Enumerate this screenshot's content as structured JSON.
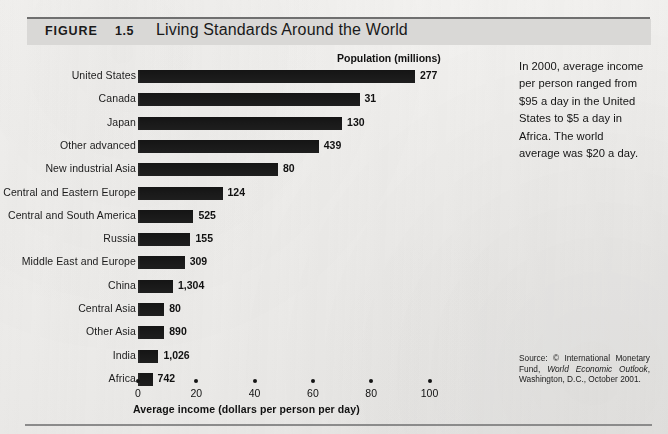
{
  "figure": {
    "kicker": "FIGURE",
    "number": "1.5",
    "title": "Living Standards Around the World"
  },
  "chart_data": {
    "type": "bar",
    "orientation": "horizontal",
    "title": "Living Standards Around the World",
    "xlabel": "Average income (dollars per person per day)",
    "ylabel": "",
    "xlim": [
      0,
      110
    ],
    "xticks": [
      0,
      20,
      40,
      60,
      80,
      100
    ],
    "grid": false,
    "legend": "none",
    "value_column_header": "Population (millions)",
    "categories": [
      "United States",
      "Canada",
      "Japan",
      "Other advanced",
      "New industrial Asia",
      "Central and Eastern Europe",
      "Central and South America",
      "Russia",
      "Middle East and Europe",
      "China",
      "Central Asia",
      "Other Asia",
      "India",
      "Africa"
    ],
    "values": [
      95,
      76,
      70,
      62,
      48,
      29,
      19,
      18,
      16,
      12,
      9,
      9,
      7,
      5
    ],
    "population_labels": [
      "277",
      "31",
      "130",
      "439",
      "80",
      "124",
      "525",
      "155",
      "309",
      "1,304",
      "80",
      "890",
      "1,026",
      "742"
    ],
    "bar_color": "#151515"
  },
  "caption": {
    "text": "In 2000, average income per person ranged from $95 a day in the United States to $5 a day in Africa. The world average was $20 a day."
  },
  "source": {
    "prefix": "Source: © International Monetary Fund, ",
    "italic": "World Economic Outlook",
    "suffix": ", Washington, D.C., October 2001."
  },
  "colors": {
    "band": "#d9d8d6",
    "rule": "#6f6f6f",
    "bar": "#151515",
    "paper": "#f2f1ef"
  }
}
